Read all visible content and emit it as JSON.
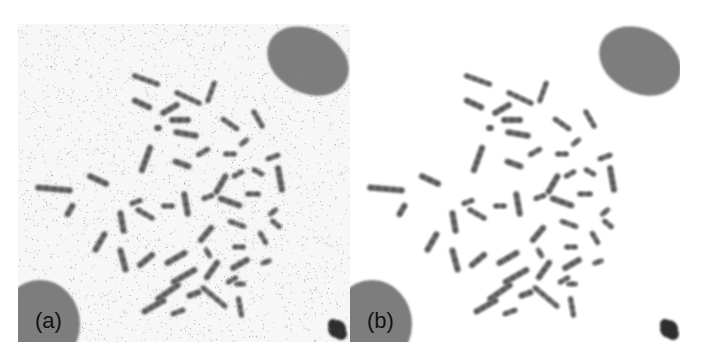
{
  "figure": {
    "panels": [
      {
        "id": "a",
        "label": "(a)",
        "description": "noisy metaphase chromosome spread"
      },
      {
        "id": "b",
        "label": "(b)",
        "description": "denoised metaphase chromosome spread"
      }
    ],
    "colors": {
      "chromosome": "#6a6a6a",
      "chromosome_dark": "#4a4a4a",
      "nucleus": "#7d7d7d",
      "debris": "#2e2e2e",
      "noise": "#8a8a8a",
      "background_a": "#f7f7f7",
      "background_b": "#ffffff"
    },
    "nuclei": [
      {
        "name": "top-right-nucleus",
        "cx": 290,
        "cy": 37,
        "rx": 43,
        "ry": 32,
        "rot": 28
      },
      {
        "name": "bottom-left-nucleus",
        "cx": 22,
        "cy": 300,
        "rx": 40,
        "ry": 44,
        "rot": 0
      }
    ],
    "debris": [
      {
        "name": "debris-blob",
        "cx": 319,
        "cy": 305,
        "r": 9
      }
    ],
    "chromosomes": [
      [
        128,
        56,
        30,
        5,
        20
      ],
      [
        170,
        74,
        30,
        5,
        25
      ],
      [
        193,
        68,
        24,
        5,
        -70
      ],
      [
        124,
        80,
        22,
        6,
        25
      ],
      [
        152,
        85,
        22,
        6,
        -30
      ],
      [
        162,
        96,
        22,
        6,
        0
      ],
      [
        212,
        100,
        22,
        5,
        35
      ],
      [
        240,
        95,
        22,
        5,
        60
      ],
      [
        168,
        110,
        26,
        6,
        10
      ],
      [
        140,
        104,
        8,
        6,
        0
      ],
      [
        128,
        135,
        30,
        6,
        -70
      ],
      [
        164,
        140,
        20,
        6,
        20
      ],
      [
        185,
        128,
        16,
        5,
        -30
      ],
      [
        212,
        130,
        14,
        5,
        0
      ],
      [
        226,
        118,
        12,
        5,
        -40
      ],
      [
        203,
        160,
        24,
        6,
        -60
      ],
      [
        220,
        150,
        14,
        5,
        -30
      ],
      [
        240,
        148,
        14,
        5,
        30
      ],
      [
        255,
        133,
        16,
        5,
        -20
      ],
      [
        262,
        155,
        28,
        6,
        80
      ],
      [
        36,
        165,
        38,
        6,
        5
      ],
      [
        80,
        156,
        24,
        6,
        25
      ],
      [
        52,
        186,
        16,
        6,
        -60
      ],
      [
        118,
        178,
        14,
        5,
        -20
      ],
      [
        127,
        190,
        22,
        5,
        30
      ],
      [
        150,
        182,
        14,
        5,
        0
      ],
      [
        168,
        180,
        26,
        6,
        80
      ],
      [
        190,
        173,
        14,
        5,
        -20
      ],
      [
        212,
        178,
        26,
        6,
        20
      ],
      [
        235,
        170,
        16,
        5,
        0
      ],
      [
        255,
        188,
        12,
        5,
        -40
      ],
      [
        104,
        198,
        24,
        6,
        80
      ],
      [
        82,
        218,
        24,
        6,
        -60
      ],
      [
        105,
        236,
        26,
        6,
        75
      ],
      [
        128,
        236,
        22,
        6,
        -40
      ],
      [
        158,
        234,
        26,
        6,
        -30
      ],
      [
        188,
        210,
        22,
        6,
        -50
      ],
      [
        219,
        200,
        20,
        5,
        20
      ],
      [
        221,
        223,
        14,
        5,
        0
      ],
      [
        194,
        246,
        24,
        6,
        -55
      ],
      [
        222,
        240,
        22,
        6,
        -30
      ],
      [
        245,
        214,
        16,
        5,
        60
      ],
      [
        258,
        200,
        14,
        5,
        40
      ],
      [
        166,
        252,
        30,
        6,
        -30
      ],
      [
        214,
        256,
        14,
        5,
        -30
      ],
      [
        150,
        268,
        30,
        6,
        -35
      ],
      [
        176,
        270,
        16,
        6,
        -20
      ],
      [
        196,
        273,
        34,
        5,
        40
      ],
      [
        222,
        260,
        12,
        5,
        0
      ],
      [
        222,
        283,
        22,
        5,
        80
      ],
      [
        136,
        282,
        28,
        6,
        -30
      ],
      [
        160,
        288,
        16,
        5,
        -20
      ],
      [
        190,
        229,
        12,
        5,
        60
      ],
      [
        248,
        238,
        12,
        5,
        -20
      ]
    ]
  }
}
